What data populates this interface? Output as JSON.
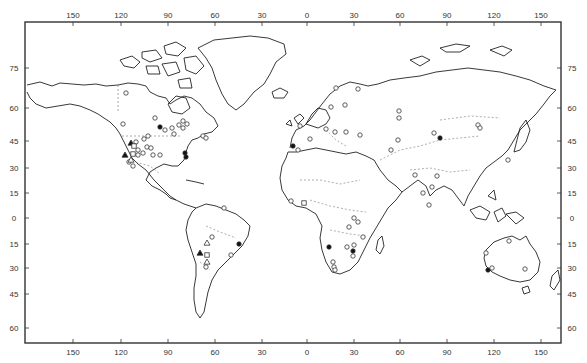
{
  "map": {
    "projection": "world outline (equirectangular-like)",
    "frame": {
      "left": 25,
      "top": 22,
      "right": 561,
      "bottom": 343
    },
    "colors": {
      "ink": "#222222",
      "border": "#555555",
      "background": "#ffffff"
    },
    "longitude_ticks": [
      {
        "label": "150",
        "x": 73
      },
      {
        "label": "120",
        "x": 121
      },
      {
        "label": "90",
        "x": 168
      },
      {
        "label": "60",
        "x": 215
      },
      {
        "label": "30",
        "x": 262
      },
      {
        "label": "0",
        "x": 307
      },
      {
        "label": "30",
        "x": 354
      },
      {
        "label": "60",
        "x": 400
      },
      {
        "label": "90",
        "x": 447
      },
      {
        "label": "120",
        "x": 494
      },
      {
        "label": "150",
        "x": 541
      }
    ],
    "latitude_ticks": [
      {
        "label": "75",
        "y": 68
      },
      {
        "label": "60",
        "y": 108
      },
      {
        "label": "45",
        "y": 141
      },
      {
        "label": "30",
        "y": 168
      },
      {
        "label": "15",
        "y": 193
      },
      {
        "label": "0",
        "y": 218
      },
      {
        "label": "15",
        "y": 244
      },
      {
        "label": "30",
        "y": 268
      },
      {
        "label": "45",
        "y": 294
      },
      {
        "label": "60",
        "y": 328
      }
    ],
    "markers": [
      {
        "type": "open-circle",
        "x": 126,
        "y": 93
      },
      {
        "type": "open-circle",
        "x": 123,
        "y": 124
      },
      {
        "type": "open-circle",
        "x": 155,
        "y": 118
      },
      {
        "type": "filled-circle",
        "x": 160,
        "y": 127
      },
      {
        "type": "open-circle",
        "x": 165,
        "y": 130
      },
      {
        "type": "open-circle",
        "x": 172,
        "y": 128
      },
      {
        "type": "open-circle",
        "x": 179,
        "y": 125
      },
      {
        "type": "open-circle",
        "x": 183,
        "y": 121
      },
      {
        "type": "open-circle",
        "x": 187,
        "y": 124
      },
      {
        "type": "open-circle",
        "x": 183,
        "y": 128
      },
      {
        "type": "open-circle",
        "x": 174,
        "y": 134
      },
      {
        "type": "open-circle",
        "x": 148,
        "y": 136
      },
      {
        "type": "open-circle",
        "x": 144,
        "y": 139
      },
      {
        "type": "open-circle",
        "x": 136,
        "y": 142
      },
      {
        "type": "filled-triangle",
        "x": 131,
        "y": 143
      },
      {
        "type": "open-square",
        "x": 134,
        "y": 146
      },
      {
        "type": "open-circle",
        "x": 138,
        "y": 150
      },
      {
        "type": "open-circle",
        "x": 147,
        "y": 147
      },
      {
        "type": "open-circle",
        "x": 151,
        "y": 148
      },
      {
        "type": "open-circle",
        "x": 143,
        "y": 153
      },
      {
        "type": "open-circle",
        "x": 153,
        "y": 155
      },
      {
        "type": "open-circle",
        "x": 160,
        "y": 155
      },
      {
        "type": "open-circle",
        "x": 138,
        "y": 155
      },
      {
        "type": "open-square",
        "x": 133,
        "y": 154
      },
      {
        "type": "filled-triangle",
        "x": 125,
        "y": 155
      },
      {
        "type": "open-circle",
        "x": 129,
        "y": 162
      },
      {
        "type": "open-circle",
        "x": 133,
        "y": 166
      },
      {
        "type": "open-triangle",
        "x": 131,
        "y": 160
      },
      {
        "type": "filled-circle",
        "x": 185,
        "y": 153
      },
      {
        "type": "filled-circle",
        "x": 186,
        "y": 157
      },
      {
        "type": "open-circle",
        "x": 203,
        "y": 136
      },
      {
        "type": "open-circle",
        "x": 206,
        "y": 138
      },
      {
        "type": "open-circle",
        "x": 212,
        "y": 237
      },
      {
        "type": "filled-circle",
        "x": 239,
        "y": 244
      },
      {
        "type": "open-circle",
        "x": 231,
        "y": 255
      },
      {
        "type": "open-triangle",
        "x": 207,
        "y": 243
      },
      {
        "type": "filled-triangle",
        "x": 200,
        "y": 253
      },
      {
        "type": "open-square",
        "x": 207,
        "y": 255
      },
      {
        "type": "open-triangle",
        "x": 207,
        "y": 262
      },
      {
        "type": "open-circle",
        "x": 206,
        "y": 267
      },
      {
        "type": "open-circle",
        "x": 224,
        "y": 208
      },
      {
        "type": "open-circle",
        "x": 336,
        "y": 88
      },
      {
        "type": "open-circle",
        "x": 358,
        "y": 89
      },
      {
        "type": "open-circle",
        "x": 331,
        "y": 107
      },
      {
        "type": "open-circle",
        "x": 345,
        "y": 105
      },
      {
        "type": "open-circle",
        "x": 300,
        "y": 126
      },
      {
        "type": "open-circle",
        "x": 326,
        "y": 129
      },
      {
        "type": "open-circle",
        "x": 335,
        "y": 132
      },
      {
        "type": "open-circle",
        "x": 346,
        "y": 132
      },
      {
        "type": "open-circle",
        "x": 360,
        "y": 135
      },
      {
        "type": "open-circle",
        "x": 310,
        "y": 139
      },
      {
        "type": "filled-circle",
        "x": 293,
        "y": 146
      },
      {
        "type": "open-circle",
        "x": 298,
        "y": 150
      },
      {
        "type": "open-circle",
        "x": 399,
        "y": 111
      },
      {
        "type": "open-circle",
        "x": 399,
        "y": 118
      },
      {
        "type": "open-circle",
        "x": 398,
        "y": 140
      },
      {
        "type": "open-circle",
        "x": 391,
        "y": 150
      },
      {
        "type": "open-circle",
        "x": 291,
        "y": 201
      },
      {
        "type": "open-square",
        "x": 304,
        "y": 203
      },
      {
        "type": "open-circle",
        "x": 354,
        "y": 218
      },
      {
        "type": "open-circle",
        "x": 358,
        "y": 222
      },
      {
        "type": "open-circle",
        "x": 349,
        "y": 227
      },
      {
        "type": "open-circle",
        "x": 363,
        "y": 237
      },
      {
        "type": "filled-circle",
        "x": 329,
        "y": 247
      },
      {
        "type": "open-circle",
        "x": 347,
        "y": 247
      },
      {
        "type": "open-circle",
        "x": 354,
        "y": 245
      },
      {
        "type": "filled-circle",
        "x": 353,
        "y": 251
      },
      {
        "type": "open-circle",
        "x": 353,
        "y": 256
      },
      {
        "type": "open-circle",
        "x": 333,
        "y": 262
      },
      {
        "type": "open-circle",
        "x": 334,
        "y": 267
      },
      {
        "type": "open-circle",
        "x": 335,
        "y": 270
      },
      {
        "type": "open-circle",
        "x": 434,
        "y": 133
      },
      {
        "type": "filled-circle",
        "x": 440,
        "y": 138
      },
      {
        "type": "open-circle",
        "x": 478,
        "y": 125
      },
      {
        "type": "open-circle",
        "x": 480,
        "y": 128
      },
      {
        "type": "open-circle",
        "x": 415,
        "y": 175
      },
      {
        "type": "open-circle",
        "x": 437,
        "y": 176
      },
      {
        "type": "open-circle",
        "x": 432,
        "y": 187
      },
      {
        "type": "open-circle",
        "x": 423,
        "y": 193
      },
      {
        "type": "open-circle",
        "x": 429,
        "y": 205
      },
      {
        "type": "open-circle",
        "x": 508,
        "y": 160
      },
      {
        "type": "open-circle",
        "x": 509,
        "y": 241
      },
      {
        "type": "open-circle",
        "x": 486,
        "y": 253
      },
      {
        "type": "filled-circle",
        "x": 488,
        "y": 270
      },
      {
        "type": "open-circle",
        "x": 492,
        "y": 268
      },
      {
        "type": "open-circle",
        "x": 525,
        "y": 269
      }
    ]
  }
}
